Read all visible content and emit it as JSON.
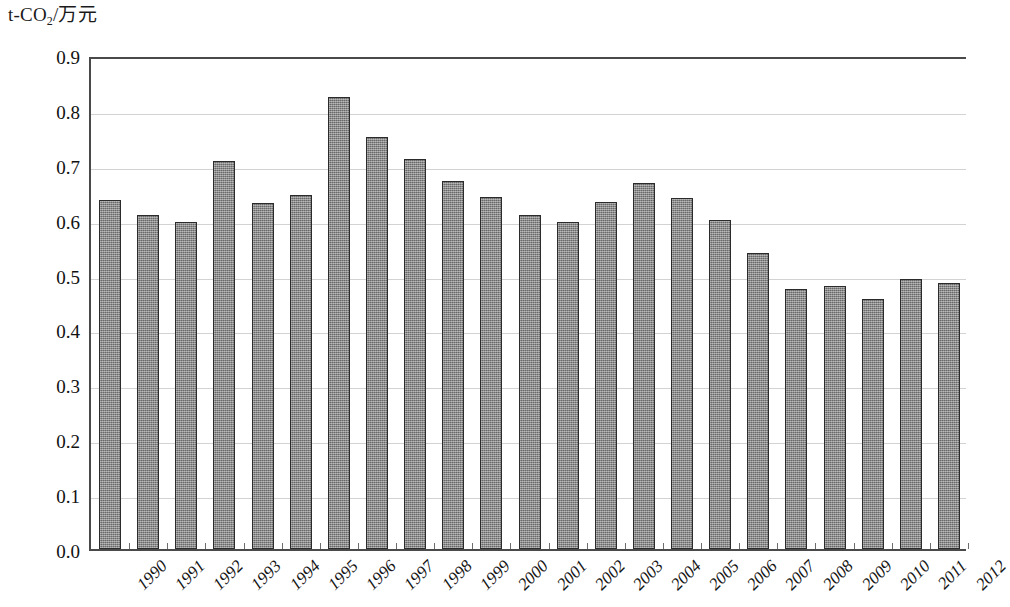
{
  "chart_data": {
    "type": "bar",
    "title": "",
    "subtitle": "",
    "ylabel": "t-CO2/万元",
    "ylabel_parts": {
      "prefix": "t-CO",
      "subscript": "2",
      "suffix": "/万元"
    },
    "xlabel": "",
    "ylim": [
      0.0,
      0.9
    ],
    "yticks": [
      "0.0",
      "0.1",
      "0.2",
      "0.3",
      "0.4",
      "0.5",
      "0.6",
      "0.7",
      "0.8",
      "0.9"
    ],
    "grid": true,
    "grid_axis": "y",
    "legend": null,
    "legend_position": "none",
    "categories": [
      "1990",
      "1991",
      "1992",
      "1993",
      "1994",
      "1995",
      "1996",
      "1997",
      "1998",
      "1999",
      "2000",
      "2001",
      "2002",
      "2003",
      "2004",
      "2005",
      "2006",
      "2007",
      "2008",
      "2009",
      "2010",
      "2011",
      "2012"
    ],
    "values": [
      0.635,
      0.608,
      0.595,
      0.707,
      0.63,
      0.645,
      0.824,
      0.751,
      0.711,
      0.67,
      0.641,
      0.608,
      0.596,
      0.632,
      0.667,
      0.639,
      0.599,
      0.54,
      0.474,
      0.479,
      0.456,
      0.492,
      0.484
    ],
    "bar_color": "#7e7e7e",
    "bar_edge_color": "#2b2b2b",
    "grid_color": "#d2d2d2",
    "axis_color": "#4a4a4a",
    "text_color": "#111111"
  }
}
